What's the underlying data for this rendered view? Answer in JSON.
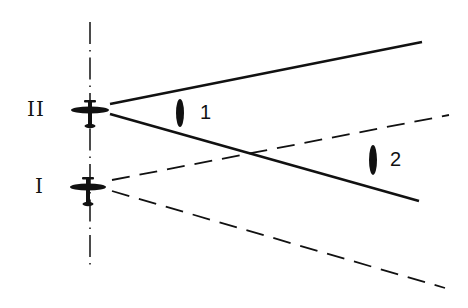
{
  "diagram": {
    "aircraft": [
      {
        "id": "II",
        "label": "II",
        "center": [
          90,
          110
        ]
      },
      {
        "id": "I",
        "label": "I",
        "center": [
          88,
          186
        ]
      }
    ],
    "beams": [
      {
        "from": "II",
        "style": "solid",
        "upper_end": [
          422,
          42
        ],
        "lower_end": [
          419,
          201
        ]
      },
      {
        "from": "I",
        "style": "dashed",
        "upper_end": [
          449,
          115
        ],
        "lower_end": [
          445,
          288
        ]
      }
    ],
    "targets": [
      {
        "label": "1",
        "position": [
          180,
          113
        ]
      },
      {
        "label": "2",
        "position": [
          373,
          160
        ]
      }
    ],
    "axis": {
      "style": "dash-dot",
      "x": 90,
      "y_range": [
        22,
        265
      ]
    },
    "colors": {
      "ink": "#111111",
      "background": "#ffffff"
    }
  }
}
